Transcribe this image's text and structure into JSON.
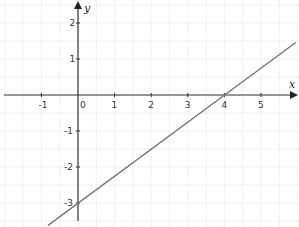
{
  "chart_data": {
    "type": "line",
    "title": "",
    "xlabel": "x",
    "ylabel": "y",
    "xlim": [
      -2.1,
      6.0
    ],
    "ylim": [
      -3.5,
      2.6
    ],
    "grid": true,
    "grid_step": 0.5,
    "x_ticks": [
      -1,
      0,
      1,
      2,
      3,
      4,
      5
    ],
    "x_tick_labels": [
      "-1",
      "0",
      "1",
      "2",
      "3",
      "4",
      "5"
    ],
    "y_ticks": [
      -3,
      -2,
      -1,
      1,
      2
    ],
    "y_tick_labels": [
      "-3",
      "-2",
      "-1",
      "1",
      "2"
    ],
    "series": [
      {
        "name": "line",
        "equation": "y = 0.75x - 3",
        "slope": 0.75,
        "intercept": -3,
        "x": [
          -0.82,
          5.95
        ],
        "y": [
          -3.62,
          1.46
        ],
        "color": "#777777"
      }
    ],
    "key_points": {
      "y_intercept": [
        0,
        -3
      ],
      "x_intercept": [
        4,
        0
      ]
    }
  },
  "colors": {
    "axis": "#333333",
    "grid": "#e6e6e6",
    "line": "#777777"
  }
}
